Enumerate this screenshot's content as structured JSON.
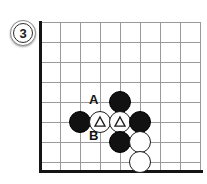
{
  "diagram": {
    "kind": "go-board-problem",
    "step_badge": {
      "number": "3"
    },
    "board": {
      "grid_color": "#9a9a9a",
      "border_color": "#141414",
      "background": "#ffffff",
      "cell_size": 20,
      "vertical_lines_x": [
        40,
        60,
        80,
        100,
        120,
        140,
        160,
        180,
        200
      ],
      "horizontal_lines_y": [
        22,
        42,
        62,
        82,
        102,
        122,
        142,
        162
      ],
      "left_border_x": 40,
      "bottom_border_y": 170
    },
    "stones": [
      {
        "id": "stone-1",
        "color": "black",
        "mark": "none",
        "x": 120,
        "y": 102
      },
      {
        "id": "stone-2",
        "color": "black",
        "mark": "none",
        "x": 80,
        "y": 122
      },
      {
        "id": "stone-3",
        "color": "white",
        "mark": "triangle",
        "x": 100,
        "y": 122
      },
      {
        "id": "stone-4",
        "color": "white",
        "mark": "triangle",
        "x": 120,
        "y": 122
      },
      {
        "id": "stone-5",
        "color": "black",
        "mark": "none",
        "x": 140,
        "y": 122
      },
      {
        "id": "stone-6",
        "color": "black",
        "mark": "none",
        "x": 120,
        "y": 142
      },
      {
        "id": "stone-7",
        "color": "white",
        "mark": "none",
        "x": 140,
        "y": 142
      },
      {
        "id": "stone-8",
        "color": "white",
        "mark": "none",
        "x": 140,
        "y": 162
      }
    ],
    "point_labels": [
      {
        "id": "label-a",
        "text": "A",
        "x": 89,
        "y": 93
      },
      {
        "id": "label-b",
        "text": "B",
        "x": 89,
        "y": 129
      }
    ]
  }
}
